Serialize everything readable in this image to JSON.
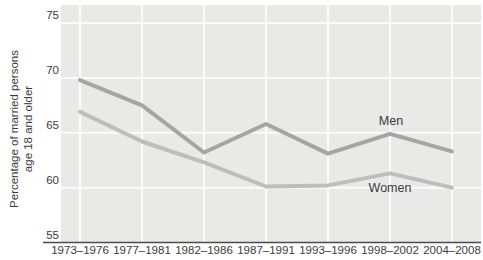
{
  "chart_data": {
    "type": "line",
    "title": "",
    "ylabel": "Percentage of married persons age 18 and older",
    "ylabel_line1": "Percentage of married persons",
    "ylabel_line2": "age 18 and older",
    "xlabel": "",
    "categories": [
      "1973–1976",
      "1977–1981",
      "1982–1986",
      "1987–1991",
      "1993–1996",
      "1998–2002",
      "2004–2008"
    ],
    "series": [
      {
        "name": "Men",
        "values": [
          69.8,
          67.5,
          63.2,
          65.8,
          63.1,
          64.9,
          63.3
        ],
        "color": "#a5a5a3"
      },
      {
        "name": "Women",
        "values": [
          66.9,
          64.2,
          62.3,
          60.1,
          60.2,
          61.3,
          60.0
        ],
        "color": "#bdbdbb"
      }
    ],
    "ylim": [
      55,
      75
    ],
    "yticks": [
      55,
      60,
      65,
      70,
      75
    ],
    "grid": true,
    "legend_position": "inline-labels-right-of-last-peak",
    "series_label_positions": [
      {
        "name": "Men",
        "x": 391,
        "y": 125
      },
      {
        "name": "Women",
        "x": 390,
        "y": 192
      }
    ],
    "colors": {
      "plot_background": "#e9e9e7",
      "gridline": "#fbfbfa",
      "axis_line": "#4b4b49",
      "tick_text": "#3b3b3b",
      "series_label_text": "#3a3a3a"
    }
  }
}
